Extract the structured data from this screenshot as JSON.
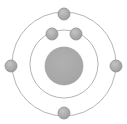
{
  "figure": {
    "caption_fragment_left": "o",
    "caption_fragment_right": "r 2",
    "background_color": "#ffffff"
  },
  "colors": {
    "nucleus_fill": "#a8a8a8",
    "nucleus_stroke": "#9a9a9a",
    "electron_fill": "#a9a9a9",
    "electron_stroke": "#8f8f8f",
    "shell_stroke": "#b5b5b5",
    "background": "#ffffff"
  },
  "chart_data": {
    "type": "scatter",
    "xlabel": "",
    "ylabel": "",
    "center": {
      "x": 64,
      "y": 64
    },
    "nucleus": {
      "label": "nucleus",
      "cx": 64,
      "cy": 66,
      "r": 19,
      "fill": "#a8a8a8"
    },
    "shells": [
      {
        "name": "inner shell",
        "index": 1,
        "cx": 64,
        "cy": 64,
        "r": 34,
        "electron_count": 2,
        "stroke": "#b5b5b5"
      },
      {
        "name": "outer shell",
        "index": 2,
        "cx": 64,
        "cy": 64,
        "r": 52,
        "electron_count": 4,
        "stroke": "#b5b5b5"
      }
    ],
    "electrons": [
      {
        "id": "e1",
        "shell": 1,
        "label": "inner-electron-left",
        "cx": 52,
        "cy": 34,
        "r": 6
      },
      {
        "id": "e2",
        "shell": 1,
        "label": "inner-electron-right",
        "cx": 76,
        "cy": 34,
        "r": 6
      },
      {
        "id": "e3",
        "shell": 2,
        "label": "outer-electron-top",
        "cx": 64,
        "cy": 14,
        "r": 6
      },
      {
        "id": "e4",
        "shell": 2,
        "label": "outer-electron-left",
        "cx": 11,
        "cy": 66,
        "r": 6
      },
      {
        "id": "e5",
        "shell": 2,
        "label": "outer-electron-right",
        "cx": 116,
        "cy": 66,
        "r": 6
      },
      {
        "id": "e6",
        "shell": 2,
        "label": "outer-electron-bottom",
        "cx": 64,
        "cy": 113,
        "r": 6
      }
    ],
    "totals": {
      "electron_count": 6,
      "shell_count": 2
    },
    "grid": false,
    "legend_position": "none"
  }
}
